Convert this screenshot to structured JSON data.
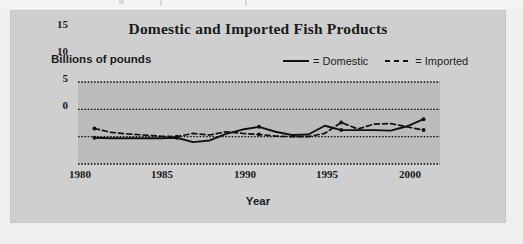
{
  "figure": {
    "title": "Domestic and Imported Fish Products"
  },
  "chart_data": {
    "type": "line",
    "title": "Domestic and Imported Fish Products",
    "xlabel": "Year",
    "ylabel": "Billions of pounds",
    "xlim": [
      1979,
      2001
    ],
    "ylim": [
      0,
      15
    ],
    "yticks": [
      0,
      5,
      10,
      15
    ],
    "xticks": [
      1980,
      1985,
      1990,
      1995,
      2000
    ],
    "grid": "horizontal-dotted",
    "legend_position": "top-right",
    "x": [
      1980,
      1981,
      1982,
      1983,
      1984,
      1985,
      1986,
      1987,
      1988,
      1989,
      1990,
      1991,
      1992,
      1993,
      1994,
      1995,
      1996,
      1997,
      1998,
      1999,
      2000
    ],
    "series": [
      {
        "name": "Domestic",
        "style": "solid",
        "legend_label": "= Domestic",
        "values": [
          4.8,
          4.7,
          4.7,
          4.7,
          4.7,
          4.8,
          4.0,
          4.3,
          5.5,
          6.3,
          6.8,
          5.9,
          5.3,
          5.4,
          7.0,
          6.2,
          6.2,
          6.2,
          6.1,
          6.9,
          8.2
        ]
      },
      {
        "name": "Imported",
        "style": "dashed",
        "legend_label": "= Imported",
        "values": [
          6.5,
          5.8,
          5.5,
          5.3,
          5.1,
          5.0,
          5.6,
          5.3,
          5.9,
          5.6,
          5.4,
          5.1,
          5.0,
          5.0,
          5.6,
          7.6,
          6.4,
          7.3,
          7.4,
          6.8,
          6.2
        ]
      }
    ]
  },
  "axes": {
    "y_tick_labels": [
      "15",
      "10",
      "5",
      "0"
    ],
    "x_tick_labels": [
      "1980",
      "1985",
      "1990",
      "1995",
      "2000"
    ]
  },
  "style": {
    "page_background": "#efefef",
    "card_background": "#cfcfcf",
    "plot_background": "#bcbcbc",
    "line_color": "#111111",
    "text_color": "#1a1a1a"
  }
}
